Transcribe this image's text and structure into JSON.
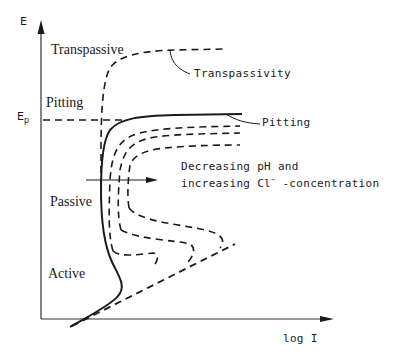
{
  "figure": {
    "type": "potentiodynamic polarization curve diagram",
    "axes": {
      "y_label": "E",
      "y_marker": "E",
      "y_marker_sub": "p",
      "x_label": "log I"
    },
    "regions": {
      "transpassive": "Transpassive",
      "pitting": "Pitting",
      "passive": "Passive",
      "active": "Active"
    },
    "annotations": {
      "transpassivity": "Transpassivity",
      "pitting": "Pitting",
      "trend_line1": "Decreasing pH and",
      "trend_line2_a": "increasing Cl",
      "trend_line2_sup": "−",
      "trend_line2_b": " -concentration"
    },
    "colors": {
      "ink": "#1a1a1a",
      "background": "#ffffff"
    }
  }
}
